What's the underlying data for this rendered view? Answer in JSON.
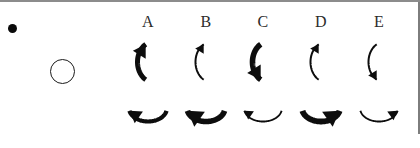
{
  "panel": {
    "width": 420,
    "height": 148,
    "background_color": "#ffffff",
    "border_color": "#8c8c8c",
    "ink_color": "#0d0d0d"
  },
  "markers": [
    {
      "name": "filled-dot",
      "shape": "dot-filled",
      "x": 12,
      "y": 28,
      "size": 9,
      "fill": "#0a0a0a"
    },
    {
      "name": "open-circle",
      "shape": "circle-outline",
      "x": 62,
      "y": 71,
      "size": 25,
      "fill": "none",
      "stroke": "#1b1b1b"
    }
  ],
  "columns": [
    {
      "label": "A",
      "x": 148
    },
    {
      "label": "B",
      "x": 206
    },
    {
      "label": "C",
      "x": 263
    },
    {
      "label": "D",
      "x": 321
    },
    {
      "label": "E",
      "x": 379
    }
  ],
  "rows": [
    {
      "name": "top-row",
      "orientation": "vertical-c-arc",
      "y": 62
    },
    {
      "name": "bottom-row",
      "orientation": "horizontal-u-arc",
      "y": 108
    }
  ],
  "arrows": {
    "top": [
      {
        "column": "A",
        "weight": "thick",
        "stroke_width": 5.0,
        "head_end": "top",
        "head_size": 9.0,
        "direction": "counterclockwise"
      },
      {
        "column": "B",
        "weight": "thin",
        "stroke_width": 2.0,
        "head_end": "top",
        "head_size": 6.0,
        "direction": "counterclockwise"
      },
      {
        "column": "C",
        "weight": "thick",
        "stroke_width": 5.6,
        "head_end": "bottom",
        "head_size": 9.5,
        "direction": "clockwise"
      },
      {
        "column": "D",
        "weight": "thin",
        "stroke_width": 2.0,
        "head_end": "top",
        "head_size": 6.0,
        "direction": "counterclockwise"
      },
      {
        "column": "E",
        "weight": "thin",
        "stroke_width": 2.0,
        "head_end": "bottom",
        "head_size": 6.0,
        "direction": "clockwise"
      }
    ],
    "bottom": [
      {
        "column": "A",
        "weight": "medium",
        "stroke_width": 4.2,
        "head_end": "left",
        "head_size": 8.5,
        "direction": "clockwise"
      },
      {
        "column": "B",
        "weight": "thick",
        "stroke_width": 5.6,
        "head_end": "left",
        "head_size": 11.0,
        "direction": "clockwise"
      },
      {
        "column": "C",
        "weight": "thin",
        "stroke_width": 1.9,
        "head_end": "left",
        "head_size": 6.0,
        "direction": "clockwise"
      },
      {
        "column": "D",
        "weight": "thick",
        "stroke_width": 5.8,
        "head_end": "right",
        "head_size": 11.0,
        "direction": "counterclockwise"
      },
      {
        "column": "E",
        "weight": "thin",
        "stroke_width": 1.9,
        "head_end": "right",
        "head_size": 6.5,
        "direction": "counterclockwise"
      }
    ]
  }
}
